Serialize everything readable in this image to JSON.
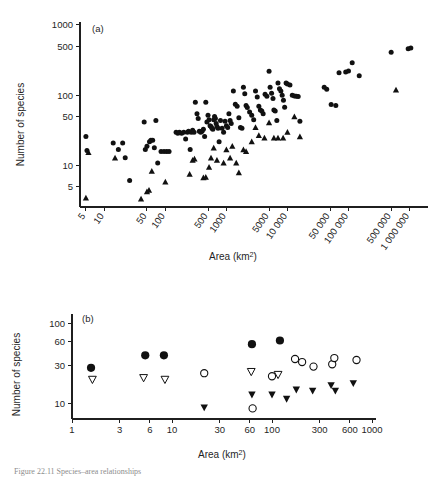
{
  "figure": {
    "title_caption": "Figure 22.11  Species–area relationships",
    "panel_a_label": "(a)",
    "panel_b_label": "(b)"
  },
  "chart_data": [
    {
      "type": "scatter",
      "id": "panel-a",
      "title": "(a)",
      "xlabel": "Area (km2)",
      "xlabel_display": "Area (km",
      "xlabel_sup": "2",
      "xlabel_tail": ")",
      "ylabel": "Number of species",
      "xscale": "log",
      "yscale": "log",
      "xlim": [
        4,
        1600000
      ],
      "ylim": [
        2.6,
        1100
      ],
      "grid": false,
      "legend": "none",
      "xticks": [
        5,
        10,
        50,
        100,
        500,
        1000,
        5000,
        10000,
        50000,
        100000,
        500000,
        1000000
      ],
      "xticklabels": [
        "5",
        "10",
        "50",
        "100",
        "500",
        "1000",
        "5000",
        "10 000",
        "50 000",
        "100 000",
        "500 000",
        "1 000 000"
      ],
      "xticklabel_rotation": -55,
      "yticks": [
        5,
        10,
        50,
        100,
        500,
        1000
      ],
      "yticklabels": [
        "5",
        "10",
        "50",
        "100",
        "500",
        "1000"
      ],
      "series": [
        {
          "name": "circles",
          "marker": "filled-circle",
          "points": [
            [
              5,
              26
            ],
            [
              5.2,
              16.5
            ],
            [
              14,
              21
            ],
            [
              17,
              17
            ],
            [
              20,
              21
            ],
            [
              22,
              13
            ],
            [
              26,
              6.2
            ],
            [
              45,
              42
            ],
            [
              47,
              17
            ],
            [
              50,
              19
            ],
            [
              55,
              22
            ],
            [
              58,
              23
            ],
            [
              62,
              23
            ],
            [
              66,
              18
            ],
            [
              70,
              44
            ],
            [
              75,
              11
            ],
            [
              85,
              16
            ],
            [
              95,
              16
            ],
            [
              105,
              16
            ],
            [
              115,
              16
            ],
            [
              150,
              30
            ],
            [
              160,
              29
            ],
            [
              170,
              30
            ],
            [
              185,
              29
            ],
            [
              200,
              30
            ],
            [
              215,
              24
            ],
            [
              230,
              30
            ],
            [
              240,
              31
            ],
            [
              255,
              17
            ],
            [
              265,
              30
            ],
            [
              280,
              32
            ],
            [
              295,
              30
            ],
            [
              310,
              80
            ],
            [
              330,
              55
            ],
            [
              345,
              47
            ],
            [
              360,
              31
            ],
            [
              380,
              30
            ],
            [
              400,
              31
            ],
            [
              420,
              33
            ],
            [
              440,
              26
            ],
            [
              460,
              80
            ],
            [
              480,
              42
            ],
            [
              500,
              52
            ],
            [
              520,
              45
            ],
            [
              540,
              37
            ],
            [
              560,
              36
            ],
            [
              580,
              34
            ],
            [
              600,
              33
            ],
            [
              620,
              45
            ],
            [
              640,
              50
            ],
            [
              660,
              47
            ],
            [
              680,
              40
            ],
            [
              700,
              36
            ],
            [
              730,
              34
            ],
            [
              760,
              22
            ],
            [
              800,
              44
            ],
            [
              850,
              34
            ],
            [
              900,
              30
            ],
            [
              950,
              43
            ],
            [
              1000,
              37
            ],
            [
              1050,
              35
            ],
            [
              1100,
              55
            ],
            [
              1150,
              44
            ],
            [
              1200,
              40
            ],
            [
              1300,
              115
            ],
            [
              1400,
              75
            ],
            [
              1500,
              70
            ],
            [
              1600,
              48
            ],
            [
              1700,
              35
            ],
            [
              1800,
              34
            ],
            [
              1900,
              130
            ],
            [
              2000,
              105
            ],
            [
              2100,
              72
            ],
            [
              2200,
              67
            ],
            [
              2400,
              58
            ],
            [
              2600,
              52
            ],
            [
              2800,
              45
            ],
            [
              3000,
              115
            ],
            [
              3200,
              95
            ],
            [
              3400,
              70
            ],
            [
              3600,
              62
            ],
            [
              3800,
              60
            ],
            [
              4000,
              55
            ],
            [
              4300,
              104
            ],
            [
              4600,
              97
            ],
            [
              5000,
              220
            ],
            [
              5200,
              130
            ],
            [
              5500,
              107
            ],
            [
              5800,
              90
            ],
            [
              6000,
              62
            ],
            [
              6300,
              60
            ],
            [
              6700,
              44
            ],
            [
              7000,
              150
            ],
            [
              7400,
              124
            ],
            [
              7800,
              115
            ],
            [
              8200,
              100
            ],
            [
              8600,
              85
            ],
            [
              9000,
              68
            ],
            [
              9500,
              150
            ],
            [
              10000,
              145
            ],
            [
              11000,
              140
            ],
            [
              12000,
              100
            ],
            [
              13000,
              98
            ],
            [
              14000,
              97
            ],
            [
              15000,
              96
            ],
            [
              16000,
              43
            ],
            [
              40000,
              130
            ],
            [
              44000,
              122
            ],
            [
              52000,
              74
            ],
            [
              62000,
              72
            ],
            [
              70000,
              210
            ],
            [
              90000,
              215
            ],
            [
              100000,
              222
            ],
            [
              115000,
              290
            ],
            [
              150000,
              190
            ],
            [
              500000,
              410
            ],
            [
              950000,
              460
            ],
            [
              1050000,
              470
            ]
          ]
        },
        {
          "name": "triangles",
          "marker": "filled-triangle",
          "points": [
            [
              5,
              3.5
            ],
            [
              5.5,
              15.5
            ],
            [
              15,
              13
            ],
            [
              40,
              3.4
            ],
            [
              50,
              4.3
            ],
            [
              54,
              4.5
            ],
            [
              60,
              8.4
            ],
            [
              100,
              5.9
            ],
            [
              250,
              7.6
            ],
            [
              280,
              12
            ],
            [
              300,
              12.5
            ],
            [
              420,
              6.8
            ],
            [
              460,
              6.9
            ],
            [
              520,
              9.6
            ],
            [
              560,
              13
            ],
            [
              620,
              18
            ],
            [
              700,
              12
            ],
            [
              900,
              11
            ],
            [
              1000,
              17
            ],
            [
              1150,
              13
            ],
            [
              1250,
              19
            ],
            [
              1450,
              11
            ],
            [
              1600,
              8.0
            ],
            [
              1900,
              17
            ],
            [
              2100,
              16
            ],
            [
              2600,
              22
            ],
            [
              3000,
              35
            ],
            [
              3400,
              27
            ],
            [
              4200,
              25
            ],
            [
              5000,
              41
            ],
            [
              6000,
              25
            ],
            [
              7000,
              25
            ],
            [
              8500,
              25
            ],
            [
              10000,
              30
            ],
            [
              13000,
              50
            ],
            [
              16000,
              26
            ],
            [
              600000,
              120
            ]
          ]
        }
      ]
    },
    {
      "type": "scatter",
      "id": "panel-b",
      "title": "(b)",
      "xlabel": "Area (km2)",
      "xlabel_display": "Area (km",
      "xlabel_sup": "2",
      "xlabel_tail": ")",
      "ylabel": "Number of species",
      "xscale": "log",
      "yscale": "log",
      "xlim": [
        1,
        1000
      ],
      "ylim": [
        6.5,
        130
      ],
      "grid": false,
      "legend": "none",
      "xticks": [
        1,
        3,
        6,
        10,
        30,
        60,
        100,
        300,
        600,
        1000
      ],
      "xticklabels": [
        "1",
        "3",
        "6",
        "10",
        "30",
        "60",
        "100",
        "300",
        "600",
        "1000"
      ],
      "yticks": [
        10,
        30,
        60,
        100
      ],
      "yticklabels": [
        "10",
        "30",
        "60",
        "100"
      ],
      "series": [
        {
          "name": "filled-circles",
          "marker": "filled-circle-large",
          "points": [
            [
              1.55,
              28
            ],
            [
              5.4,
              40
            ],
            [
              8.3,
              40
            ],
            [
              63,
              55
            ],
            [
              120,
              61
            ]
          ]
        },
        {
          "name": "open-circles",
          "marker": "open-circle",
          "points": [
            [
              21,
              24
            ],
            [
              64,
              8.8
            ],
            [
              100,
              22
            ],
            [
              170,
              36
            ],
            [
              200,
              33
            ],
            [
              260,
              29
            ],
            [
              400,
              31
            ],
            [
              420,
              37
            ],
            [
              700,
              35
            ]
          ]
        },
        {
          "name": "open-triangles-down",
          "marker": "open-triangle-down",
          "points": [
            [
              1.6,
              20
            ],
            [
              5.2,
              21
            ],
            [
              8.5,
              20
            ],
            [
              62,
              25
            ],
            [
              115,
              23
            ]
          ]
        },
        {
          "name": "filled-triangles-down",
          "marker": "filled-triangle-down",
          "points": [
            [
              21,
              9.0
            ],
            [
              63,
              13
            ],
            [
              100,
              13
            ],
            [
              140,
              11.5
            ],
            [
              175,
              15
            ],
            [
              255,
              14.5
            ],
            [
              390,
              17
            ],
            [
              430,
              14.5
            ],
            [
              650,
              18
            ]
          ]
        }
      ]
    }
  ]
}
